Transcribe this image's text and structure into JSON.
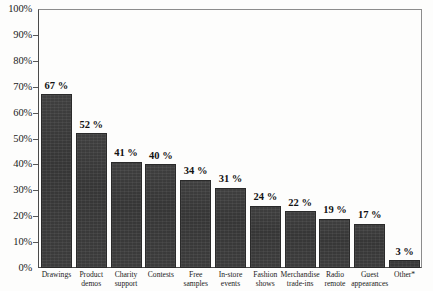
{
  "chart_data": {
    "type": "bar",
    "title": "",
    "subtitle": "",
    "xlabel": "",
    "ylabel": "",
    "ylim": [
      0,
      100
    ],
    "grid": false,
    "legend": "none",
    "orientation": "vertical",
    "value_suffix": "%",
    "categories": [
      "Drawings",
      "Product demos",
      "Charity support",
      "Contests",
      "Free samples",
      "In-store events",
      "Fashion shows",
      "Merchandise trade-ins",
      "Radio remote",
      "Guest appearances",
      "Other*"
    ],
    "category_lines": [
      [
        "Drawings",
        ""
      ],
      [
        "Product",
        "demos"
      ],
      [
        "Charity",
        "support"
      ],
      [
        "Contests",
        ""
      ],
      [
        "Free",
        "samples"
      ],
      [
        "In-store",
        "events"
      ],
      [
        "Fashion",
        "shows"
      ],
      [
        "Merchandise",
        "trade-ins"
      ],
      [
        "Radio",
        "remote"
      ],
      [
        "Guest",
        "appearances"
      ],
      [
        "Other*",
        ""
      ]
    ],
    "values": [
      67,
      52,
      41,
      40,
      34,
      31,
      24,
      22,
      19,
      17,
      3
    ],
    "value_labels": [
      "67 %",
      "52 %",
      "41 %",
      "40 %",
      "34 %",
      "31 %",
      "24 %",
      "22 %",
      "19 %",
      "17 %",
      "3 %"
    ],
    "y_ticks": [
      0,
      10,
      20,
      30,
      40,
      50,
      60,
      70,
      80,
      90,
      100
    ],
    "y_tick_labels": [
      "0%",
      "10%",
      "20%",
      "30%",
      "40%",
      "50%",
      "60%",
      "70%",
      "80%",
      "90%",
      "100%"
    ],
    "bar_color": "#3b3b3b",
    "axis_color": "#4a4a4a",
    "frame_color": "#8c8c8c",
    "text_color": "#1b1b1b"
  }
}
